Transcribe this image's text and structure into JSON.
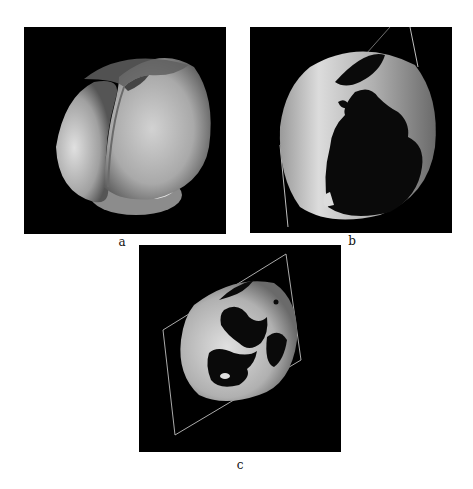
{
  "figure": {
    "panels": [
      {
        "id": "a",
        "label": "a",
        "description": "3D surface rendering of heart, full grey surface"
      },
      {
        "id": "b",
        "label": "b",
        "description": "3D surface rendering of heart with dark mapped regions and cutting plane edge"
      },
      {
        "id": "c",
        "label": "c",
        "description": "3D surface rendering of heart, rotated, with dark mapped regions and rhombus cutting plane"
      }
    ]
  },
  "colors": {
    "background": "#ffffff",
    "panel_bg": "#000000",
    "surface_light": "#c8c8c8",
    "surface_mid": "#9a9a9a",
    "surface_dark": "#5a5a5a",
    "region_dark": "#0a0a0a",
    "plane_line": "#bdbdbd"
  }
}
